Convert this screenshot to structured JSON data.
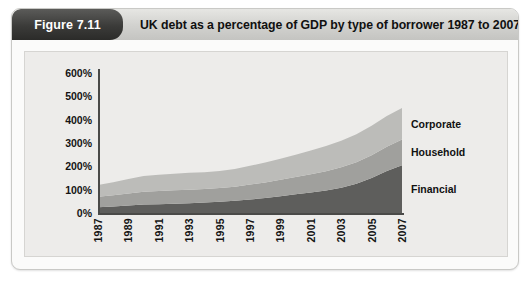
{
  "figure": {
    "number_label": "Figure 7.11",
    "caption": "UK debt as a percentage of GDP by type of borrower 1987 to 2007"
  },
  "chart_data": {
    "type": "area",
    "stacked": true,
    "title": "UK debt as a percentage of GDP by type of borrower 1987 to 2007",
    "xlabel": "",
    "ylabel": "",
    "ylim": [
      0,
      600
    ],
    "ytick_labels": [
      "600%",
      "500%",
      "400%",
      "300%",
      "200%",
      "100%",
      "0%"
    ],
    "ytick_values": [
      600,
      500,
      400,
      300,
      200,
      100,
      0
    ],
    "xlim": [
      1987,
      2007
    ],
    "grid": false,
    "legend_position": "right-inline",
    "tick_labels_x": [
      "1987",
      "1989",
      "1991",
      "1993",
      "1995",
      "1997",
      "1999",
      "2001",
      "2003",
      "2005",
      "2007"
    ],
    "x": [
      1987,
      1988,
      1989,
      1990,
      1991,
      1992,
      1993,
      1994,
      1995,
      1996,
      1997,
      1998,
      1999,
      2000,
      2001,
      2002,
      2003,
      2004,
      2005,
      2006,
      2007
    ],
    "series": [
      {
        "name": "Financial",
        "color": "#5e5e5c",
        "values": [
          25,
          28,
          32,
          36,
          38,
          40,
          42,
          45,
          48,
          52,
          58,
          64,
          72,
          80,
          88,
          96,
          108,
          125,
          150,
          180,
          205
        ]
      },
      {
        "name": "Household",
        "color": "#a0a09d",
        "values": [
          45,
          48,
          52,
          55,
          56,
          57,
          58,
          58,
          59,
          61,
          64,
          67,
          70,
          74,
          78,
          83,
          88,
          93,
          98,
          104,
          110
        ]
      },
      {
        "name": "Corporate",
        "color": "#bcbcb9",
        "values": [
          50,
          56,
          62,
          68,
          70,
          71,
          72,
          72,
          73,
          76,
          80,
          85,
          90,
          96,
          102,
          108,
          114,
          120,
          126,
          132,
          135
        ]
      }
    ],
    "totals": [
      120,
      132,
      146,
      159,
      164,
      168,
      172,
      175,
      180,
      189,
      202,
      216,
      232,
      250,
      268,
      287,
      310,
      338,
      374,
      416,
      450
    ]
  },
  "series_labels": [
    {
      "name": "Corporate"
    },
    {
      "name": "Household"
    },
    {
      "name": "Financial"
    }
  ],
  "colors": {
    "financial": "#5e5e5c",
    "household": "#a0a09d",
    "corporate": "#bcbcb9",
    "plot_background": "#edecea",
    "card_background": "#fbfbfa",
    "axis": "#4a4a48",
    "tab_background": "#3b3b39"
  }
}
